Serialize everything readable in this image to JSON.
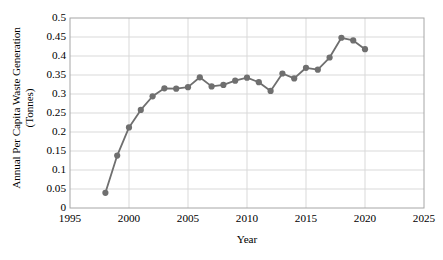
{
  "chart_data": {
    "type": "line",
    "title": "",
    "xlabel": "Year",
    "ylabel": "Annual Per Capita Waste Generation (Tonnes)",
    "ylabel_line1": "Annual Per Capita Waste Generation",
    "ylabel_line2": "(Tonnes)",
    "xlim": [
      1995,
      2025
    ],
    "ylim": [
      0,
      0.5
    ],
    "grid": true,
    "legend": "none",
    "marker": "circle",
    "series_color": "#6f6f6f",
    "x": [
      1998,
      1999,
      2000,
      2001,
      2002,
      2003,
      2004,
      2005,
      2006,
      2007,
      2008,
      2009,
      2010,
      2011,
      2012,
      2013,
      2014,
      2015,
      2016,
      2017,
      2018,
      2019,
      2020
    ],
    "values": [
      0.04,
      0.138,
      0.212,
      0.258,
      0.294,
      0.315,
      0.314,
      0.318,
      0.344,
      0.32,
      0.324,
      0.335,
      0.343,
      0.331,
      0.308,
      0.354,
      0.341,
      0.369,
      0.364,
      0.396,
      0.448,
      0.441,
      0.418
    ],
    "series": [
      {
        "name": "Annual Per Capita Waste Generation",
        "values": [
          0.04,
          0.138,
          0.212,
          0.258,
          0.294,
          0.315,
          0.314,
          0.318,
          0.344,
          0.32,
          0.324,
          0.335,
          0.343,
          0.331,
          0.308,
          0.354,
          0.341,
          0.369,
          0.364,
          0.396,
          0.448,
          0.441,
          0.418
        ]
      }
    ],
    "xticks": [
      1995,
      2000,
      2005,
      2010,
      2015,
      2020,
      2025
    ],
    "xtick_labels": [
      "1995",
      "2000",
      "2005",
      "2010",
      "2015",
      "2020",
      "2025"
    ],
    "yticks": [
      0,
      0.05,
      0.1,
      0.15,
      0.2,
      0.25,
      0.3,
      0.35,
      0.4,
      0.45,
      0.5
    ],
    "ytick_labels": [
      "0",
      "0.05",
      "0.1",
      "0.15",
      "0.2",
      "0.25",
      "0.3",
      "0.35",
      "0.4",
      "0.45",
      "0.5"
    ]
  },
  "plot_area": {
    "left": 70,
    "top": 18,
    "right": 424,
    "bottom": 208
  },
  "style": {
    "border_color": "#a6a6a6",
    "grid_color": "#d9d9d9",
    "background": "#ffffff"
  }
}
